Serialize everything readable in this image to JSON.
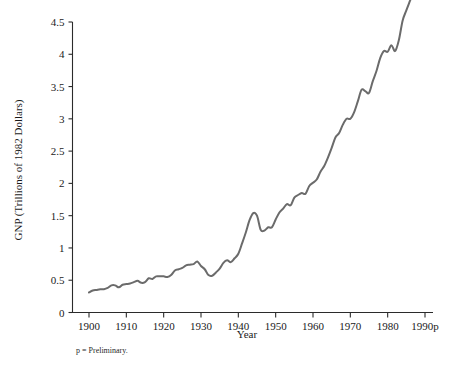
{
  "chart_data": {
    "type": "line",
    "title": "",
    "subtitle": "",
    "xlabel": "Year",
    "ylabel": "GNP (Trillions of 1982 Dollars)",
    "xlim": [
      1898,
      1992
    ],
    "ylim": [
      0,
      4.5
    ],
    "grid": false,
    "legend": "none",
    "line_color": "#6b6b6b",
    "axis_color": "#2b2b2b",
    "xticks": [
      1900,
      1910,
      1920,
      1930,
      1940,
      1950,
      1960,
      1970,
      1980,
      1990
    ],
    "xtick_labels": [
      "1900",
      "1910",
      "1920",
      "1930",
      "1940",
      "1950",
      "1960",
      "1970",
      "1980",
      "1990p"
    ],
    "yticks": [
      0,
      0.5,
      1,
      1.5,
      2,
      2.5,
      3,
      3.5,
      4,
      4.5
    ],
    "ytick_labels": [
      "0",
      "0.5",
      "1",
      "1.5",
      "2",
      "2.5",
      "3",
      "3.5",
      "4",
      "4.5"
    ],
    "annotations": [
      "p = Preliminary."
    ],
    "series": [
      {
        "name": "GNP",
        "x": [
          1900,
          1901,
          1902,
          1903,
          1904,
          1905,
          1906,
          1907,
          1908,
          1909,
          1910,
          1911,
          1912,
          1913,
          1914,
          1915,
          1916,
          1917,
          1918,
          1919,
          1920,
          1921,
          1922,
          1923,
          1924,
          1925,
          1926,
          1927,
          1928,
          1929,
          1930,
          1931,
          1932,
          1933,
          1934,
          1935,
          1936,
          1937,
          1938,
          1939,
          1940,
          1941,
          1942,
          1943,
          1944,
          1945,
          1946,
          1947,
          1948,
          1949,
          1950,
          1951,
          1952,
          1953,
          1954,
          1955,
          1956,
          1957,
          1958,
          1959,
          1960,
          1961,
          1962,
          1963,
          1964,
          1965,
          1966,
          1967,
          1968,
          1969,
          1970,
          1971,
          1972,
          1973,
          1974,
          1975,
          1976,
          1977,
          1978,
          1979,
          1980,
          1981,
          1982,
          1983,
          1984,
          1985,
          1986,
          1987,
          1988,
          1989,
          1990
        ],
        "values": [
          0.31,
          0.34,
          0.35,
          0.36,
          0.36,
          0.38,
          0.42,
          0.42,
          0.39,
          0.43,
          0.44,
          0.45,
          0.47,
          0.49,
          0.46,
          0.47,
          0.53,
          0.52,
          0.56,
          0.56,
          0.56,
          0.55,
          0.58,
          0.65,
          0.67,
          0.69,
          0.73,
          0.74,
          0.75,
          0.79,
          0.72,
          0.67,
          0.58,
          0.57,
          0.62,
          0.68,
          0.77,
          0.81,
          0.78,
          0.84,
          0.91,
          1.07,
          1.24,
          1.43,
          1.54,
          1.5,
          1.28,
          1.27,
          1.32,
          1.32,
          1.44,
          1.55,
          1.61,
          1.68,
          1.66,
          1.78,
          1.82,
          1.85,
          1.84,
          1.96,
          2.01,
          2.06,
          2.18,
          2.27,
          2.4,
          2.55,
          2.71,
          2.78,
          2.91,
          3.0,
          3.0,
          3.1,
          3.27,
          3.45,
          3.43,
          3.4,
          3.58,
          3.74,
          3.94,
          4.05,
          4.04,
          4.14,
          4.05,
          4.22,
          4.52,
          4.68,
          4.83,
          4.98,
          5.18,
          5.34,
          5.4
        ],
        "values_displayed": [
          0.31,
          0.34,
          0.35,
          0.36,
          0.36,
          0.38,
          0.42,
          0.42,
          0.39,
          0.43,
          0.44,
          0.45,
          0.47,
          0.49,
          0.46,
          0.47,
          0.53,
          0.52,
          0.56,
          0.56,
          0.56,
          0.55,
          0.58,
          0.65,
          0.67,
          0.69,
          0.73,
          0.74,
          0.75,
          0.79,
          0.72,
          0.67,
          0.58,
          0.57,
          0.62,
          0.68,
          0.77,
          0.81,
          0.78,
          0.84,
          0.91,
          1.07,
          1.24,
          1.43,
          1.54,
          1.5,
          1.28,
          1.27,
          1.32,
          1.32,
          1.44,
          1.55,
          1.61,
          1.68,
          1.66,
          1.78,
          1.82,
          1.85,
          1.84,
          1.96,
          2.01,
          2.06,
          2.18,
          2.27,
          2.4,
          2.55,
          2.71,
          2.78,
          2.91,
          3.0,
          3.0,
          3.1,
          3.27,
          3.45,
          3.43,
          3.4,
          3.58,
          3.74,
          3.94,
          4.05,
          4.04,
          4.14,
          4.05,
          4.22,
          4.52,
          4.68,
          4.83,
          4.98,
          5.18,
          5.34,
          5.4
        ]
      }
    ]
  },
  "footnote": {
    "text": "p = Preliminary."
  }
}
